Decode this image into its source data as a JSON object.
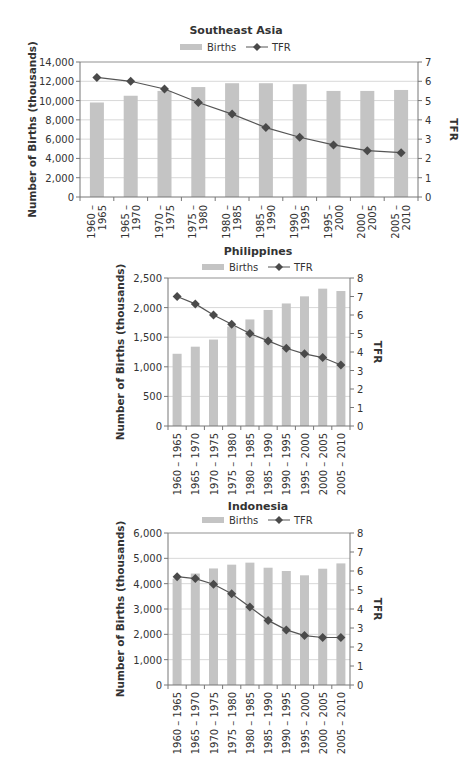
{
  "chart_data": [
    {
      "type": "bar+line",
      "title": "Southeast Asia",
      "categories": [
        "1960 – 1965",
        "1965 – 1970",
        "1970 – 1975",
        "1975 – 1980",
        "1980 – 1985",
        "1985 – 1990",
        "1990 – 1995",
        "1995 – 2000",
        "2000 – 2005",
        "2005 – 2010"
      ],
      "category_lines": [
        [
          "1960 –",
          "1965"
        ],
        [
          "1965 –",
          "1970"
        ],
        [
          "1970 –",
          "1975"
        ],
        [
          "1975 –",
          "1980"
        ],
        [
          "1980 –",
          "1985"
        ],
        [
          "1985 –",
          "1990"
        ],
        [
          "1990 –",
          "1995"
        ],
        [
          "1995 –",
          "2000"
        ],
        [
          "2000 –",
          "2005"
        ],
        [
          "2005 –",
          "2010"
        ]
      ],
      "series": [
        {
          "name": "Births",
          "type": "bar",
          "axis": "left",
          "values": [
            9800,
            10500,
            11000,
            11400,
            11800,
            11800,
            11700,
            11000,
            11000,
            11100
          ]
        },
        {
          "name": "TFR",
          "type": "line",
          "axis": "right",
          "values": [
            6.2,
            6.0,
            5.6,
            4.9,
            4.3,
            3.6,
            3.1,
            2.7,
            2.4,
            2.3
          ]
        }
      ],
      "ylabel": "Number of Births (thousands)",
      "y2label": "TFR",
      "ylim": [
        0,
        14000
      ],
      "yticks": [
        "0",
        "2,000",
        "4,000",
        "6,000",
        "8,000",
        "10,000",
        "12,000",
        "14,000"
      ],
      "y2lim": [
        0,
        7
      ],
      "y2ticks": [
        "0",
        "1",
        "2",
        "3",
        "4",
        "5",
        "6",
        "7"
      ],
      "legend": [
        "Births",
        "TFR"
      ],
      "legend_position": "top",
      "grid": true
    },
    {
      "type": "bar+line",
      "title": "Philippines",
      "categories": [
        "1960 – 1965",
        "1965 – 1970",
        "1970 – 1975",
        "1975 – 1980",
        "1980 – 1985",
        "1985 – 1990",
        "1990 – 1995",
        "1995 – 2000",
        "2000 – 2005",
        "2005 – 2010"
      ],
      "series": [
        {
          "name": "Births",
          "type": "bar",
          "axis": "left",
          "values": [
            1220,
            1340,
            1460,
            1680,
            1800,
            1960,
            2070,
            2190,
            2320,
            2280
          ]
        },
        {
          "name": "TFR",
          "type": "line",
          "axis": "right",
          "values": [
            7.0,
            6.6,
            6.0,
            5.5,
            5.0,
            4.6,
            4.2,
            3.9,
            3.7,
            3.3
          ]
        }
      ],
      "ylabel": "Number of Births (thousands)",
      "y2label": "TFR",
      "ylim": [
        0,
        2500
      ],
      "yticks": [
        "0",
        "500",
        "1,000",
        "1,500",
        "2,000",
        "2,500"
      ],
      "y2lim": [
        0,
        8
      ],
      "y2ticks": [
        "0",
        "1",
        "2",
        "3",
        "4",
        "5",
        "6",
        "7",
        "8"
      ],
      "legend": [
        "Births",
        "TFR"
      ],
      "legend_position": "top",
      "grid": true
    },
    {
      "type": "bar+line",
      "title": "Indonesia",
      "categories": [
        "1960 – 1965",
        "1965 – 1970",
        "1970 – 1975",
        "1975 – 1980",
        "1980 – 1985",
        "1985 – 1990",
        "1990 – 1995",
        "1995 – 2000",
        "2000 – 2005",
        "2005 – 2010"
      ],
      "series": [
        {
          "name": "Births",
          "type": "bar",
          "axis": "left",
          "values": [
            4200,
            4400,
            4600,
            4750,
            4830,
            4630,
            4500,
            4330,
            4590,
            4800
          ]
        },
        {
          "name": "TFR",
          "type": "line",
          "axis": "right",
          "values": [
            5.7,
            5.6,
            5.3,
            4.8,
            4.1,
            3.4,
            2.9,
            2.6,
            2.5,
            2.5
          ]
        }
      ],
      "ylabel": "Number of Births (thousands)",
      "y2label": "TFR",
      "ylim": [
        0,
        6000
      ],
      "yticks": [
        "0",
        "1,000",
        "2,000",
        "3,000",
        "4,000",
        "5,000",
        "6,000"
      ],
      "y2lim": [
        0,
        8
      ],
      "y2ticks": [
        "0",
        "1",
        "2",
        "3",
        "4",
        "5",
        "6",
        "7",
        "8"
      ],
      "legend": [
        "Births",
        "TFR"
      ],
      "legend_position": "top",
      "grid": true
    }
  ],
  "colors": {
    "bar": "#c4c4c4",
    "line": "#555555",
    "marker": "#4a4a4a",
    "grid": "#d8d8d8",
    "axis": "#777777"
  }
}
